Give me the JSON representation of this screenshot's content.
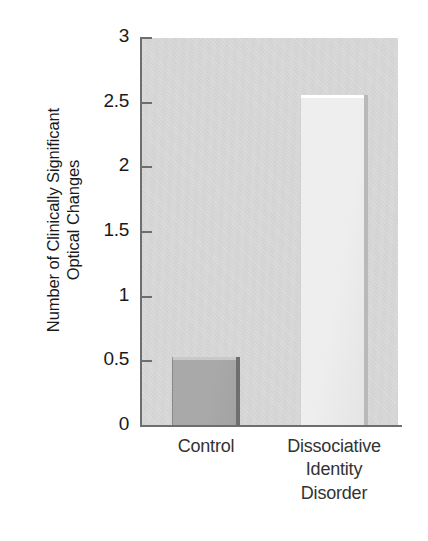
{
  "chart_data": {
    "type": "bar",
    "title": "",
    "subtitle": "",
    "xlabel": "",
    "ylabel_lines": [
      "Number of Clinically Significant",
      "Optical Changes"
    ],
    "ylabel": "Number of Clinically Significant Optical Changes",
    "categories": [
      "Control",
      "Dissociative Identity Disorder"
    ],
    "category_label_lines": [
      [
        "Control"
      ],
      [
        "Dissociative",
        "Identity",
        "Disorder"
      ]
    ],
    "values": [
      0.53,
      2.56
    ],
    "ylim": [
      0,
      3
    ],
    "ytick_values": [
      0,
      0.5,
      1,
      1.5,
      2,
      2.5,
      3
    ],
    "ytick_labels": [
      "0",
      "0.5",
      "1",
      "1.5",
      "2",
      "2.5",
      "3"
    ],
    "grid": false,
    "legend": "none",
    "annotations": [],
    "series": [
      {
        "name": "Number of Clinically Significant Optical Changes",
        "values": [
          0.53,
          2.56
        ]
      }
    ]
  },
  "style": {
    "plot_background": "#dadada",
    "axis_color": "#6e6e6e",
    "text_color": "#1a1a1a",
    "tick_label_color": "#1a1a1a",
    "category_label_color": "#333333",
    "bar_colors": [
      "#a9a9a9",
      "#eeeeee"
    ],
    "bar_shadow_colors": [
      "#6f6f6f",
      "#b9b9b9"
    ],
    "bar_highlight_colors": [
      "#c9c9c9",
      "#ffffff"
    ],
    "figure_background": "#ffffff"
  }
}
